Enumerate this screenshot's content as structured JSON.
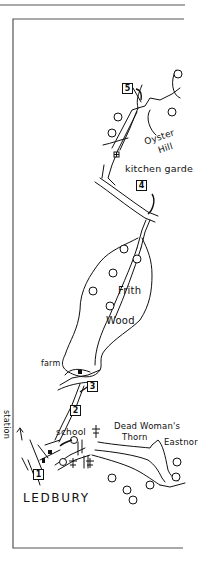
{
  "map": {
    "title": "LEDBURY",
    "labels": {
      "oyster": "Oyster",
      "hill": "Hill",
      "kitchen_garden": "kitchen garde",
      "frith": "Frith",
      "wood": "Wood",
      "farm": "farm",
      "station": "station",
      "school": "school",
      "dead_womans": "Dead Woman's",
      "thorn": "Thorn",
      "eastnor": "Eastnor"
    },
    "waypoints": [
      "1",
      "2",
      "3",
      "4",
      "5"
    ],
    "colors": {
      "ink": "#111111",
      "frame": "#555555",
      "background": "#ffffff"
    }
  }
}
